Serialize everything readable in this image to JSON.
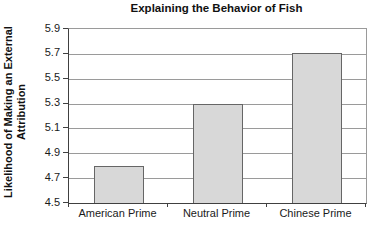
{
  "chart_data": {
    "type": "bar",
    "title": "Explaining the Behavior of Fish",
    "categories": [
      "American Prime",
      "Neutral Prime",
      "Chinese Prime"
    ],
    "values": [
      4.8,
      5.3,
      5.71
    ],
    "xlabel": "",
    "ylabel": "Likelihood of Making an External Attribution",
    "ylim": [
      4.5,
      5.9
    ],
    "ytick_step": 0.2,
    "yticks": [
      4.5,
      4.7,
      4.9,
      5.1,
      5.3,
      5.5,
      5.7,
      5.9
    ],
    "grid": true,
    "legend": false,
    "bar_fill": "#d8d8d8",
    "bar_border": "#666666",
    "gridline_color": "#9a9a9a",
    "axis_color": "#404040"
  },
  "y_axis_title": {
    "line1": "Likelihood of Making an External",
    "line2": "Attribution"
  }
}
